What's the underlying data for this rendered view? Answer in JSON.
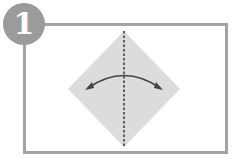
{
  "step": {
    "number": "1"
  },
  "colors": {
    "frame": "#a3a3a3",
    "badge": "#9b9b9b",
    "paper": "#dcdcdc",
    "fold_line": "#333333",
    "arrow": "#444444"
  },
  "diagram": {
    "shape": "square-diamond",
    "fold": "vertical valley fold (dashed) through center",
    "arrow": "double-headed curved arrow, fold and unfold"
  }
}
